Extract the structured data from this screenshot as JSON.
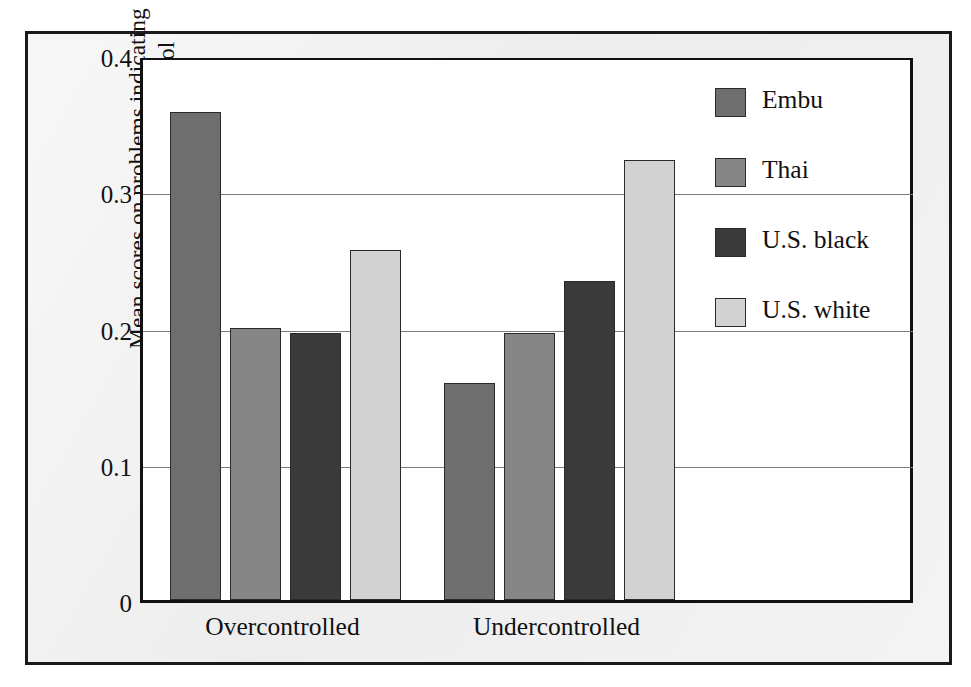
{
  "figure": {
    "background_color": "#eeeeee",
    "plot_background_color": "#ffffff",
    "frame_color": "#1a1a1a"
  },
  "chart_data": {
    "type": "bar",
    "title": "",
    "subtitle": "",
    "xlabel": "",
    "ylabel": "Mean scores on problems indicating overcontrol and undercontrol",
    "ylabel_line1": "Mean scores on problems indicating",
    "ylabel_line2": "overcontrol and undercontrol",
    "categories": [
      "Overcontrolled",
      "Undercontrolled"
    ],
    "ylim": [
      0,
      0.4
    ],
    "yticks": [
      0,
      0.1,
      0.2,
      0.3,
      0.4
    ],
    "ytick_labels": [
      "0",
      "0.1",
      "0.2",
      "0.3",
      "0.4"
    ],
    "grid": true,
    "grid_axis": "y",
    "legend_position": "right",
    "series": [
      {
        "name": "Embu",
        "color": "#6e6e6e",
        "values": [
          0.358,
          0.159
        ]
      },
      {
        "name": "Thai",
        "color": "#868686",
        "values": [
          0.2,
          0.196
        ]
      },
      {
        "name": "U.S. black",
        "color": "#3a3a3a",
        "values": [
          0.196,
          0.234
        ]
      },
      {
        "name": "U.S. white",
        "color": "#d2d2d2",
        "values": [
          0.257,
          0.323
        ]
      }
    ]
  },
  "legend": {
    "items": [
      {
        "label": "Embu",
        "color": "#6e6e6e"
      },
      {
        "label": "Thai",
        "color": "#868686"
      },
      {
        "label": "U.S. black",
        "color": "#3a3a3a"
      },
      {
        "label": "U.S. white",
        "color": "#d2d2d2"
      }
    ]
  }
}
